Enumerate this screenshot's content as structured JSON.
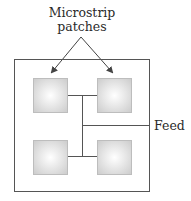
{
  "diagram": {
    "title_line1": "Microstrip",
    "title_line2": "patches",
    "feed_label": "Feed",
    "colors": {
      "line": "#555555",
      "patch_fill_center": "#ffffff",
      "patch_fill_edge": "#d4d4d4",
      "patch_stroke": "#bdbdbd",
      "text": "#2a2a2a"
    },
    "patches": [
      {
        "id": "top-left"
      },
      {
        "id": "top-right"
      },
      {
        "id": "bottom-left"
      },
      {
        "id": "bottom-right"
      }
    ]
  }
}
